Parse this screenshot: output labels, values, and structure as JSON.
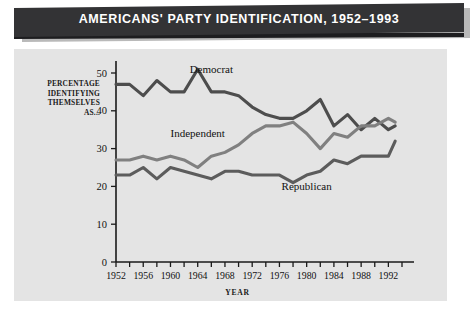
{
  "banner": {
    "title": "AMERICANS' PARTY IDENTIFICATION, 1952–1993"
  },
  "axes": {
    "y_caption_lines": [
      "PERCENTAGE",
      "IDENTIFYING",
      "THEMSELVES",
      "AS..."
    ],
    "x_caption": "YEAR"
  },
  "colors": {
    "banner_bg": "#333335",
    "panel_bg": "#e4e4e4",
    "axis": "#1a1a1a",
    "democrat": "#4d4d4d",
    "independent": "#808080",
    "republican": "#5c5c5c"
  },
  "chart_data": {
    "type": "line",
    "title": "AMERICANS' PARTY IDENTIFICATION, 1952–1993",
    "xlabel": "YEAR",
    "ylabel": "PERCENTAGE IDENTIFYING THEMSELVES AS...",
    "xlim": [
      1952,
      1994
    ],
    "ylim": [
      0,
      52
    ],
    "yticks": [
      0,
      10,
      20,
      30,
      40,
      50
    ],
    "ytick_labels": [
      "0",
      "10",
      "20",
      "30",
      "40",
      "50"
    ],
    "xticks": [
      1952,
      1954,
      1956,
      1958,
      1960,
      1962,
      1964,
      1966,
      1968,
      1970,
      1972,
      1974,
      1976,
      1978,
      1980,
      1982,
      1984,
      1986,
      1988,
      1990,
      1992,
      1994
    ],
    "xtick_labels": [
      "1952",
      "1956",
      "1960",
      "1964",
      "1968",
      "1972",
      "1976",
      "1980",
      "1984",
      "1988",
      "1992"
    ],
    "xtick_label_years": [
      1952,
      1956,
      1960,
      1964,
      1968,
      1972,
      1976,
      1980,
      1984,
      1988,
      1992
    ],
    "grid": false,
    "legend": "inline-annotations",
    "x": [
      1952,
      1954,
      1956,
      1958,
      1960,
      1962,
      1964,
      1966,
      1968,
      1970,
      1972,
      1974,
      1976,
      1978,
      1980,
      1982,
      1984,
      1986,
      1988,
      1990,
      1992,
      1993
    ],
    "series": [
      {
        "name": "Democrat",
        "color": "#4d4d4d",
        "label_x": 1966,
        "label_y": 50,
        "values": [
          47,
          47,
          44,
          48,
          45,
          45,
          51,
          45,
          45,
          44,
          41,
          39,
          38,
          38,
          40,
          43,
          36,
          39,
          35,
          38,
          35,
          36
        ]
      },
      {
        "name": "Independent",
        "color": "#808080",
        "label_x": 1964,
        "label_y": 33,
        "values": [
          27,
          27,
          28,
          27,
          28,
          27,
          25,
          28,
          29,
          31,
          34,
          36,
          36,
          37,
          34,
          30,
          34,
          33,
          36,
          36,
          38,
          37
        ]
      },
      {
        "name": "Republican",
        "color": "#5c5c5c",
        "label_x": 1980,
        "label_y": 19,
        "values": [
          23,
          23,
          25,
          22,
          25,
          24,
          23,
          22,
          24,
          24,
          23,
          23,
          23,
          21,
          23,
          24,
          27,
          26,
          28,
          28,
          28,
          32
        ]
      }
    ]
  }
}
